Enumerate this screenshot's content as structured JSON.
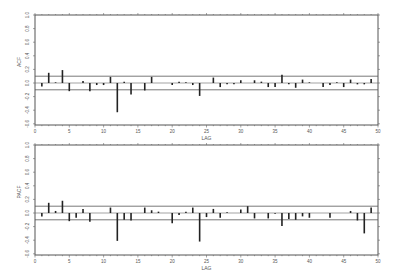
{
  "chart_data": [
    {
      "type": "bar",
      "title": "",
      "ylabel": "ACF",
      "xlabel": "LAG",
      "xlim": [
        0,
        50
      ],
      "ylim": [
        -0.65,
        1.0
      ],
      "xticks": [
        0,
        5,
        10,
        15,
        20,
        25,
        30,
        35,
        40,
        45,
        50
      ],
      "yticks": [
        1.0,
        0.8,
        0.6,
        0.4,
        0.2,
        0.0,
        -0.2,
        -0.4,
        -0.6
      ],
      "confidence_band": [
        -0.1,
        0.1
      ],
      "grid": false,
      "x": [
        1,
        2,
        3,
        4,
        5,
        6,
        7,
        8,
        9,
        10,
        11,
        12,
        13,
        14,
        15,
        16,
        17,
        18,
        19,
        20,
        21,
        22,
        23,
        24,
        25,
        26,
        27,
        28,
        29,
        30,
        31,
        32,
        33,
        34,
        35,
        36,
        37,
        38,
        39,
        40,
        41,
        42,
        43,
        44,
        45,
        46,
        47,
        48,
        49,
        50
      ],
      "values": [
        -0.05,
        0.15,
        0.01,
        0.19,
        -0.12,
        0.0,
        0.03,
        -0.12,
        -0.03,
        -0.03,
        0.09,
        -0.43,
        0.02,
        -0.17,
        0.0,
        -0.11,
        0.09,
        0.0,
        0.0,
        -0.03,
        0.02,
        0.01,
        -0.03,
        -0.19,
        0.0,
        0.08,
        -0.06,
        -0.02,
        -0.02,
        0.04,
        0.0,
        0.04,
        0.02,
        -0.06,
        -0.06,
        0.12,
        -0.02,
        -0.07,
        0.05,
        0.01,
        0.0,
        -0.06,
        -0.03,
        0.01,
        -0.06,
        0.05,
        -0.02,
        -0.02,
        0.06,
        0.0
      ]
    },
    {
      "type": "bar",
      "title": "",
      "ylabel": "PACF",
      "xlabel": "LAG",
      "xlim": [
        0,
        50
      ],
      "ylim": [
        -0.65,
        1.0
      ],
      "xticks": [
        0,
        5,
        10,
        15,
        20,
        25,
        30,
        35,
        40,
        45,
        50
      ],
      "yticks": [
        1.0,
        0.8,
        0.6,
        0.4,
        0.2,
        0.0,
        -0.2,
        -0.4,
        -0.6
      ],
      "confidence_band": [
        -0.1,
        0.1
      ],
      "grid": false,
      "x": [
        1,
        2,
        3,
        4,
        5,
        6,
        7,
        8,
        9,
        10,
        11,
        12,
        13,
        14,
        15,
        16,
        17,
        18,
        19,
        20,
        21,
        22,
        23,
        24,
        25,
        26,
        27,
        28,
        29,
        30,
        31,
        32,
        33,
        34,
        35,
        36,
        37,
        38,
        39,
        40,
        41,
        42,
        43,
        44,
        45,
        46,
        47,
        48,
        49,
        50
      ],
      "values": [
        -0.05,
        0.15,
        0.03,
        0.18,
        -0.12,
        -0.07,
        0.06,
        -0.13,
        0.0,
        0.0,
        0.08,
        -0.41,
        -0.1,
        -0.11,
        0.0,
        0.08,
        0.04,
        0.02,
        0.0,
        -0.15,
        -0.03,
        0.02,
        0.08,
        -0.42,
        -0.06,
        0.06,
        -0.07,
        0.01,
        0.0,
        0.05,
        0.1,
        -0.08,
        0.0,
        -0.08,
        -0.01,
        -0.19,
        -0.09,
        -0.1,
        -0.05,
        -0.07,
        0.0,
        0.0,
        -0.07,
        0.0,
        0.0,
        0.03,
        -0.11,
        -0.3,
        0.08,
        0.0
      ]
    }
  ],
  "panels": [
    {
      "ylabel": "ACF",
      "xlabel": "LAG"
    },
    {
      "ylabel": "PACF",
      "xlabel": "LAG"
    }
  ]
}
